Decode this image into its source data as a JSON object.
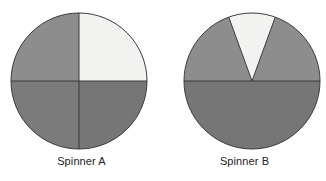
{
  "figure": {
    "background_color": "#ffffff",
    "width": 326,
    "height": 181
  },
  "chart_data": {
    "type": "pie",
    "title": "",
    "subtitle": "",
    "xlabel": "",
    "ylabel": "",
    "legend_position": "none",
    "grid": false,
    "charts": [
      {
        "name": "Spinner A",
        "caption": "Spinner A",
        "center_x": 79,
        "center_y": 81,
        "radius": 68,
        "total_degrees": 360,
        "slices": [
          {
            "label": "upper-left quadrant",
            "shade": "medium gray",
            "color": "#8d8d8d",
            "start_angle": 180,
            "end_angle": 270,
            "degrees": 90,
            "fraction": 0.25
          },
          {
            "label": "upper-right quadrant",
            "shade": "white",
            "color": "#f2f2f1",
            "start_angle": 270,
            "end_angle": 360,
            "degrees": 90,
            "fraction": 0.25
          },
          {
            "label": "lower-right quadrant",
            "shade": "dark gray",
            "color": "#767676",
            "start_angle": 0,
            "end_angle": 90,
            "degrees": 90,
            "fraction": 0.25
          },
          {
            "label": "lower-left quadrant",
            "shade": "dark gray",
            "color": "#7b7b7b",
            "start_angle": 90,
            "end_angle": 180,
            "degrees": 90,
            "fraction": 0.25
          }
        ]
      },
      {
        "name": "Spinner B",
        "caption": "Spinner B",
        "center_x": 89,
        "center_y": 81,
        "radius": 68,
        "total_degrees": 360,
        "slices": [
          {
            "label": "upper-left sector",
            "shade": "medium gray",
            "color": "#8d8d8d",
            "start_angle": 180,
            "end_angle": 250,
            "degrees": 70,
            "fraction": 0.194
          },
          {
            "label": "top white wedge",
            "shade": "white",
            "color": "#f2f2f1",
            "start_angle": 250,
            "end_angle": 290,
            "degrees": 40,
            "fraction": 0.111
          },
          {
            "label": "upper-right sector",
            "shade": "medium gray",
            "color": "#8d8d8d",
            "start_angle": 290,
            "end_angle": 360,
            "degrees": 70,
            "fraction": 0.194
          },
          {
            "label": "bottom half",
            "shade": "dark gray",
            "color": "#767676",
            "start_angle": 0,
            "end_angle": 180,
            "degrees": 180,
            "fraction": 0.5
          }
        ]
      }
    ],
    "stroke_color": "#3a3a3a",
    "stroke_width": 1
  },
  "captions": {
    "spinner_a": "Spinner A",
    "spinner_b": "Spinner B"
  },
  "colors": {
    "medium_gray": "#8d8d8d",
    "dark_gray": "#767676",
    "dark_gray_alt": "#7b7b7b",
    "white_slice": "#f2f2f1",
    "outline": "#3a3a3a",
    "caption_text": "#222222",
    "background": "#ffffff"
  }
}
